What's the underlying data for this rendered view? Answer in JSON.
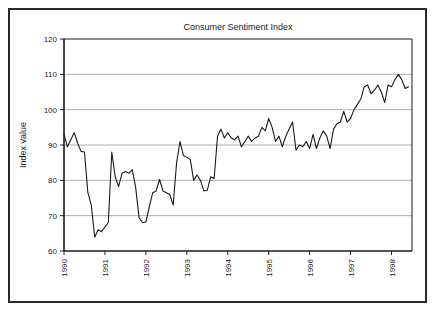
{
  "chart_data": {
    "type": "line",
    "title": "Consumer Sentiment Index",
    "xlabel": "",
    "ylabel": "Index value",
    "ylim": [
      60,
      120
    ],
    "yticks": [
      60,
      70,
      80,
      90,
      100,
      110,
      120
    ],
    "ytick_labels": [
      "60",
      "70",
      "80",
      "90",
      "100",
      "110",
      "120"
    ],
    "xlim": [
      1990.0,
      1998.5
    ],
    "xticks": [
      1990,
      1991,
      1992,
      1993,
      1994,
      1995,
      1996,
      1997,
      1998
    ],
    "xtick_labels": [
      "1990",
      "1991",
      "1992",
      "1993",
      "1994",
      "1995",
      "1996",
      "1997",
      "1998"
    ],
    "grid": "horizontal",
    "legend": "none",
    "line_color": "#1a1a1a",
    "series": [
      {
        "name": "Consumer Sentiment Index",
        "x": [
          1990.0,
          1990.083,
          1990.167,
          1990.25,
          1990.333,
          1990.417,
          1990.5,
          1990.583,
          1990.667,
          1990.75,
          1990.833,
          1990.917,
          1991.0,
          1991.083,
          1991.167,
          1991.25,
          1991.333,
          1991.417,
          1991.5,
          1991.583,
          1991.667,
          1991.75,
          1991.833,
          1991.917,
          1992.0,
          1992.083,
          1992.167,
          1992.25,
          1992.333,
          1992.417,
          1992.5,
          1992.583,
          1992.667,
          1992.75,
          1992.833,
          1992.917,
          1993.0,
          1993.083,
          1993.167,
          1993.25,
          1993.333,
          1993.417,
          1993.5,
          1993.583,
          1993.667,
          1993.75,
          1993.833,
          1993.917,
          1994.0,
          1994.083,
          1994.167,
          1994.25,
          1994.333,
          1994.417,
          1994.5,
          1994.583,
          1994.667,
          1994.75,
          1994.833,
          1994.917,
          1995.0,
          1995.083,
          1995.167,
          1995.25,
          1995.333,
          1995.417,
          1995.5,
          1995.583,
          1995.667,
          1995.75,
          1995.833,
          1995.917,
          1996.0,
          1996.083,
          1996.167,
          1996.25,
          1996.333,
          1996.417,
          1996.5,
          1996.583,
          1996.667,
          1996.75,
          1996.833,
          1996.917,
          1997.0,
          1997.083,
          1997.167,
          1997.25,
          1997.333,
          1997.417,
          1997.5,
          1997.583,
          1997.667,
          1997.75,
          1997.833,
          1997.917,
          1998.0,
          1998.083,
          1998.167,
          1998.25,
          1998.333,
          1998.417
        ],
        "values": [
          93.0,
          89.5,
          91.5,
          93.5,
          90.5,
          88.2,
          88.0,
          76.5,
          73.0,
          63.9,
          66.0,
          65.5,
          66.8,
          68.0,
          88.0,
          81.0,
          78.2,
          82.0,
          82.5,
          82.0,
          83.0,
          78.0,
          69.5,
          68.0,
          68.2,
          72.5,
          76.5,
          77.0,
          80.3,
          77.0,
          76.5,
          76.0,
          73.0,
          85.0,
          91.0,
          87.0,
          86.5,
          86.0,
          80.0,
          81.5,
          80.0,
          77.0,
          77.2,
          81.0,
          80.5,
          92.5,
          94.5,
          92.0,
          93.5,
          92.0,
          91.5,
          92.5,
          89.5,
          91.0,
          92.5,
          91.0,
          92.0,
          92.5,
          95.0,
          94.0,
          97.5,
          95.0,
          91.0,
          92.5,
          89.5,
          92.5,
          94.5,
          96.5,
          88.5,
          90.0,
          89.5,
          91.0,
          89.0,
          93.0,
          89.0,
          92.0,
          94.0,
          92.5,
          89.0,
          94.5,
          96.0,
          96.5,
          99.5,
          96.5,
          97.5,
          100.0,
          101.5,
          103.0,
          106.5,
          107.0,
          104.5,
          105.5,
          107.0,
          105.0,
          102.0,
          107.0,
          106.5,
          108.5,
          110.0,
          108.5,
          106.0,
          106.5
        ]
      }
    ]
  },
  "frame": {
    "border_color": "#2b2b2b",
    "background": "#ffffff"
  }
}
